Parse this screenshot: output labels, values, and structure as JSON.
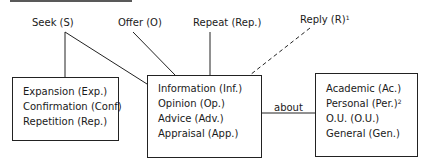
{
  "diagram": {
    "top_labels": {
      "seek": "Seek (S)",
      "offer": "Offer (O)",
      "repeat": "Repeat (Rep.)",
      "reply": "Reply (R)",
      "reply_footnote": "1"
    },
    "left_box": {
      "items": [
        "Expansion (Exp.)",
        "Confirmation (Conf)",
        "Repetition (Rep.)"
      ]
    },
    "center_box": {
      "items": [
        "Information (Inf.)",
        "Opinion (Op.)",
        "Advice (Adv.)",
        "Appraisal (App.)"
      ]
    },
    "connector_label": "about",
    "right_box": {
      "items": [
        "Academic (Ac.)",
        "Personal (Per.)",
        "O.U. (O.U.)",
        "General (Gen.)"
      ],
      "personal_footnote": "2"
    },
    "colors": {
      "line": "#222222",
      "text": "#1a1a1a",
      "background": "#ffffff"
    }
  }
}
